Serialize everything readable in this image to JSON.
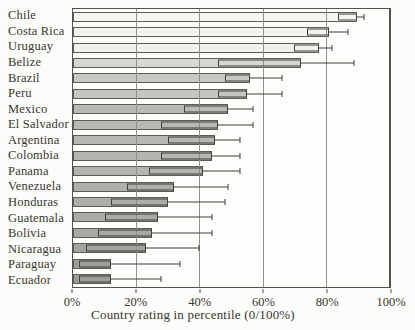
{
  "colors": {
    "background": "#fcfcfa",
    "frame": "#55534e",
    "grid": "#92918d",
    "bar_border": "#5d5b56",
    "error_bar": "#403e3a",
    "text": "#38362f"
  },
  "chart_data": {
    "type": "bar",
    "orientation": "horizontal",
    "title": "",
    "xlabel": "Country rating in percentile (0/100%)",
    "ylabel": "",
    "xlim": [
      0,
      100
    ],
    "grid": true,
    "error_bar_note": "each bar has a box from ci_low to value and a whisker from value to ci_high",
    "ticks": [
      {
        "label": "0%",
        "value": 0
      },
      {
        "label": "20%",
        "value": 20
      },
      {
        "label": "40%",
        "value": 40
      },
      {
        "label": "60%",
        "value": 60
      },
      {
        "label": "80%",
        "value": 80
      },
      {
        "label": "100%",
        "value": 100
      }
    ],
    "series": [
      {
        "country": "Chile",
        "value": 90,
        "ci_low": 84,
        "ci_high": 92,
        "fill": "#f6f5f1"
      },
      {
        "country": "Costa Rica",
        "value": 81,
        "ci_low": 74,
        "ci_high": 87,
        "fill": "#f3f2ee"
      },
      {
        "country": "Uruguay",
        "value": 78,
        "ci_low": 70,
        "ci_high": 82,
        "fill": "#f1f0ec"
      },
      {
        "country": "Belize",
        "value": 72,
        "ci_low": 46,
        "ci_high": 89,
        "fill": "#d7d6d2"
      },
      {
        "country": "Brazil",
        "value": 56,
        "ci_low": 48,
        "ci_high": 66,
        "fill": "#c9c8c4"
      },
      {
        "country": "Peru",
        "value": 55,
        "ci_low": 46,
        "ci_high": 66,
        "fill": "#c6c5c1"
      },
      {
        "country": "Mexico",
        "value": 49,
        "ci_low": 35,
        "ci_high": 57,
        "fill": "#bbbab6"
      },
      {
        "country": "El Salvador",
        "value": 46,
        "ci_low": 28,
        "ci_high": 57,
        "fill": "#b9b8b4"
      },
      {
        "country": "Argentina",
        "value": 45,
        "ci_low": 30,
        "ci_high": 53,
        "fill": "#b8b7b3"
      },
      {
        "country": "Colombia",
        "value": 44,
        "ci_low": 28,
        "ci_high": 53,
        "fill": "#b6b5b1"
      },
      {
        "country": "Panama",
        "value": 41,
        "ci_low": 24,
        "ci_high": 53,
        "fill": "#b4b3af"
      },
      {
        "country": "Venezuela",
        "value": 32,
        "ci_low": 17,
        "ci_high": 49,
        "fill": "#b0afab"
      },
      {
        "country": "Honduras",
        "value": 30,
        "ci_low": 12,
        "ci_high": 48,
        "fill": "#aeada9"
      },
      {
        "country": "Guatemala",
        "value": 27,
        "ci_low": 10,
        "ci_high": 44,
        "fill": "#acaba7"
      },
      {
        "country": "Bolivia",
        "value": 25,
        "ci_low": 8,
        "ci_high": 44,
        "fill": "#a9a8a4"
      },
      {
        "country": "Nicaragua",
        "value": 23,
        "ci_low": 4,
        "ci_high": 40,
        "fill": "#a5a4a0"
      },
      {
        "country": "Paraguay",
        "value": 12,
        "ci_low": 2,
        "ci_high": 34,
        "fill": "#a09f9b"
      },
      {
        "country": "Ecuador",
        "value": 12,
        "ci_low": 2,
        "ci_high": 28,
        "fill": "#9e9d99"
      }
    ]
  }
}
